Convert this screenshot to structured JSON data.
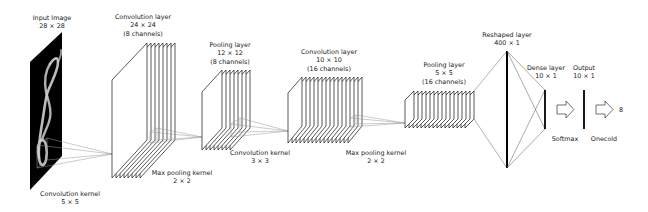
{
  "labels": {
    "input": {
      "line1": "Input Image",
      "line2": "28 × 28"
    },
    "conv1": {
      "line1": "Convolution layer",
      "line2": "24 × 24",
      "line3": "(8 channels)"
    },
    "pool1": {
      "line1": "Pooling layer",
      "line2": "12 × 12",
      "line3": "(8 channels)"
    },
    "conv2": {
      "line1": "Convolution layer",
      "line2": "10 × 10",
      "line3": "(16 channels)"
    },
    "pool2": {
      "line1": "Pooling layer",
      "line2": "5 × 5",
      "line3": "(16 channels)"
    },
    "reshaped": {
      "line1": "Reshaped layer",
      "line2": "400 × 1"
    },
    "dense": {
      "line1": "Dense layer",
      "line2": "10 × 1"
    },
    "output": {
      "line1": "Output",
      "line2": "10 × 1"
    },
    "kernel1": {
      "line1": "Convolution kernel",
      "line2": "5 × 5"
    },
    "maxpool1": {
      "line1": "Max pooling kernel",
      "line2": "2 × 2"
    },
    "kernel2": {
      "line1": "Convolution kernel",
      "line2": "3 × 3"
    },
    "maxpool2": {
      "line1": "Max pooling kernel",
      "line2": "2 × 2"
    },
    "softmax": "Softmax",
    "onecold": "Onecold",
    "prediction": "8"
  },
  "layers": [
    {
      "name": "input",
      "size": "28 × 28",
      "channels": 1
    },
    {
      "name": "conv1",
      "size": "24 × 24",
      "channels": 8
    },
    {
      "name": "pool1",
      "size": "12 × 12",
      "channels": 8
    },
    {
      "name": "conv2",
      "size": "10 × 10",
      "channels": 16
    },
    {
      "name": "pool2",
      "size": "5 × 5",
      "channels": 16
    },
    {
      "name": "reshaped",
      "size": "400 × 1"
    },
    {
      "name": "dense",
      "size": "10 × 1"
    },
    {
      "name": "output",
      "size": "10 × 1"
    }
  ],
  "colors": {
    "line": "#111111",
    "kernel": "#999999",
    "input_bg": "#000000",
    "digit": "#dddddd"
  }
}
